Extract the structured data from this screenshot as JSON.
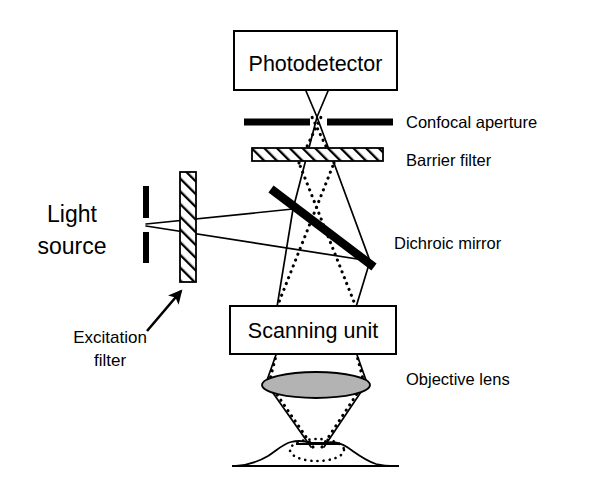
{
  "figure": {
    "background_color": "#ffffff",
    "ink_color": "#000000",
    "lens_glass_color": "#b3b3b3"
  },
  "components": {
    "photodetector": {
      "label": "Photodetector",
      "shape": "rectangle"
    },
    "confocal_aperture": {
      "label": "Confocal aperture",
      "shape": "two-bars-with-gap"
    },
    "barrier_filter": {
      "label": "Barrier filter",
      "shape": "hatched-horizontal-bar"
    },
    "dichroic_mirror": {
      "label": "Dichroic mirror",
      "shape": "thick-diagonal-bar"
    },
    "scanning_unit": {
      "label": "Scanning unit",
      "shape": "rectangle"
    },
    "objective_lens": {
      "label": "Objective lens",
      "shape": "filled-ellipse-cone"
    },
    "light_source": {
      "label_line1": "Light",
      "label_line2": "source",
      "shape": "two-vertical-slit-bars"
    },
    "excitation_filter": {
      "label_line1": "Excitation",
      "label_line2": "filter",
      "shape": "hatched-vertical-bar",
      "has_pointer_arrow": true
    },
    "specimen": {
      "shape": "irregular-blob-with-focal-spot"
    }
  },
  "beams": {
    "excitation": {
      "name": "excitation-beam",
      "style": "solid"
    },
    "emission": {
      "name": "emission-beam",
      "style": "dotted"
    }
  }
}
